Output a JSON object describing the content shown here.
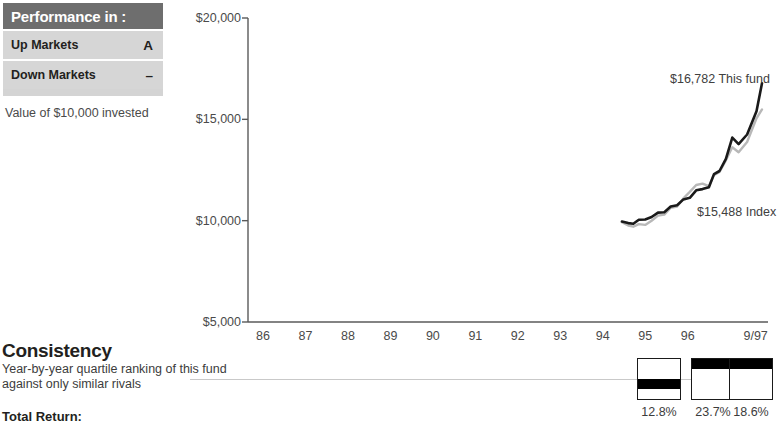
{
  "performance_table": {
    "header": "Performance in :",
    "rows": [
      {
        "label": "Up Markets",
        "grade": "A"
      },
      {
        "label": "Down Markets",
        "grade": "–"
      }
    ],
    "caption": "Value of $10,000 invested"
  },
  "consistency": {
    "title": "Consistency",
    "subtitle": "Year-by-year quartile ranking of this fund against only similar rivals",
    "total_return_label": "Total Return:"
  },
  "chart_data": {
    "type": "line",
    "title": "Value of $10,000 invested",
    "xlabel": "",
    "ylabel": "",
    "ylim": [
      5000,
      20000
    ],
    "yticks": [
      5000,
      10000,
      15000,
      20000
    ],
    "ytick_labels": [
      "$5,000",
      "$10,000",
      "$15,000",
      "$20,000"
    ],
    "grid": false,
    "legend": "inline-annotations",
    "categories": [
      "86",
      "87",
      "88",
      "89",
      "90",
      "91",
      "92",
      "93",
      "94",
      "95",
      "96",
      "9/97"
    ],
    "annotations": [
      {
        "text": "$16,782 This fund",
        "series": "This fund",
        "value": 16782
      },
      {
        "text": "$15,488 Index",
        "series": "Index",
        "value": 15488
      }
    ],
    "series": [
      {
        "name": "This fund",
        "color": "#1a1a1a",
        "x": [
          94.45,
          94.6,
          94.72,
          94.85,
          95.0,
          95.15,
          95.3,
          95.45,
          95.6,
          95.75,
          95.9,
          96.05,
          96.2,
          96.35,
          96.5,
          96.62,
          96.75,
          96.9,
          97.05,
          97.2,
          97.4,
          97.62,
          97.75
        ],
        "values": [
          9960,
          9880,
          9850,
          10050,
          10060,
          10180,
          10400,
          10420,
          10700,
          10760,
          11050,
          11130,
          11500,
          11560,
          11650,
          12300,
          12450,
          13050,
          14100,
          13780,
          14250,
          15400,
          16782
        ]
      },
      {
        "name": "Index",
        "color": "#b8b8b8",
        "x": [
          94.45,
          94.6,
          94.72,
          94.85,
          95.0,
          95.15,
          95.3,
          95.45,
          95.6,
          95.75,
          95.9,
          96.05,
          96.2,
          96.35,
          96.5,
          96.62,
          96.75,
          96.9,
          97.05,
          97.2,
          97.4,
          97.62,
          97.75
        ],
        "values": [
          9920,
          9760,
          9700,
          9830,
          9790,
          10000,
          10250,
          10300,
          10640,
          10700,
          11100,
          11420,
          11760,
          11830,
          11700,
          12250,
          12400,
          12980,
          13620,
          13380,
          13880,
          15050,
          15488
        ]
      }
    ],
    "quartile_rankings": {
      "scale_max": 4,
      "items": [
        {
          "period": "95",
          "quartile": 3,
          "total_return": "12.8%"
        },
        {
          "period": "96",
          "quartile": 1,
          "total_return": "23.7%"
        },
        {
          "period": "9/97",
          "quartile": 1,
          "total_return": "18.6%"
        }
      ]
    }
  }
}
